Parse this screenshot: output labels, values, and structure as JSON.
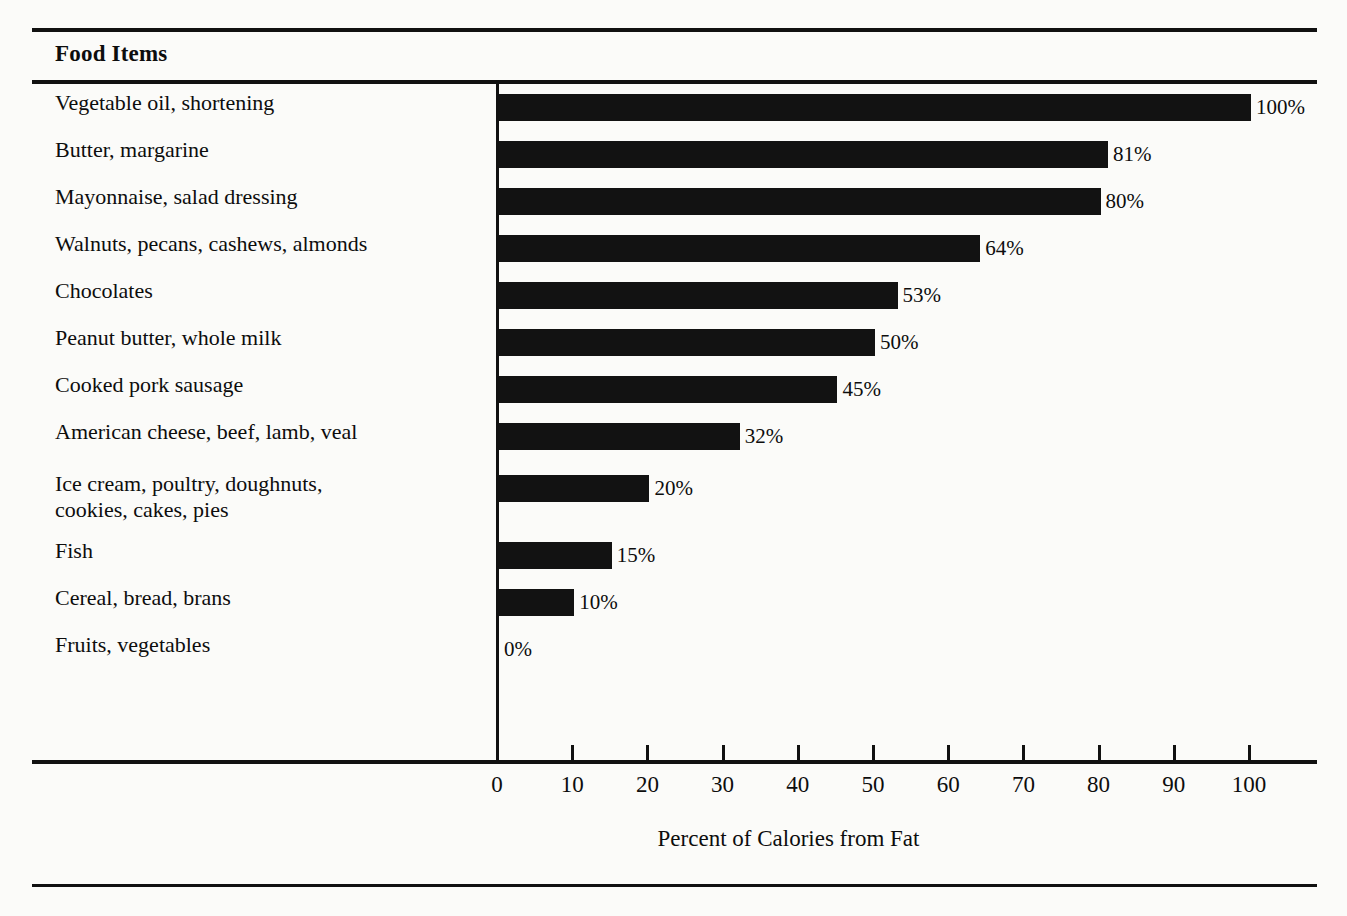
{
  "header": {
    "column_title": "Food Items"
  },
  "chart_data": {
    "type": "bar",
    "orientation": "horizontal",
    "title": "Food Items",
    "xlabel": "Percent of Calories from Fat",
    "ylabel": "",
    "xlim": [
      0,
      100
    ],
    "xticks": [
      0,
      10,
      20,
      30,
      40,
      50,
      60,
      70,
      80,
      90,
      100
    ],
    "xtick_labels": [
      "0",
      "10",
      "20",
      "30",
      "40",
      "50",
      "60",
      "70",
      "80",
      "90",
      "100"
    ],
    "grid": false,
    "legend": null,
    "bar_color": "#121212",
    "background_color": "#fbfbf9",
    "categories": [
      "Vegetable oil, shortening",
      "Butter, margarine",
      "Mayonnaise, salad dressing",
      "Walnuts, pecans, cashews, almonds",
      "Chocolates",
      "Peanut butter, whole milk",
      "Cooked pork sausage",
      "American cheese, beef, lamb, veal",
      "Ice cream, poultry, doughnuts,\ncookies, cakes, pies",
      "Fish",
      "Cereal, bread, brans",
      "Fruits, vegetables"
    ],
    "values": [
      100,
      81,
      80,
      64,
      53,
      50,
      45,
      32,
      20,
      15,
      10,
      0
    ],
    "value_labels": [
      "100%",
      "81%",
      "80%",
      "64%",
      "53%",
      "50%",
      "45%",
      "32%",
      "20%",
      "15%",
      "10%",
      "0%"
    ]
  },
  "rows": [
    {
      "label": "Vegetable oil, shortening",
      "value": 100,
      "value_label": "100%",
      "tall": false
    },
    {
      "label": "Butter, margarine",
      "value": 81,
      "value_label": "81%",
      "tall": false
    },
    {
      "label": "Mayonnaise, salad dressing",
      "value": 80,
      "value_label": "80%",
      "tall": false
    },
    {
      "label": "Walnuts, pecans, cashews, almonds",
      "value": 64,
      "value_label": "64%",
      "tall": false
    },
    {
      "label": "Chocolates",
      "value": 53,
      "value_label": "53%",
      "tall": false
    },
    {
      "label": "Peanut butter, whole milk",
      "value": 50,
      "value_label": "50%",
      "tall": false
    },
    {
      "label": "Cooked pork sausage",
      "value": 45,
      "value_label": "45%",
      "tall": false
    },
    {
      "label": "American cheese, beef, lamb, veal",
      "value": 32,
      "value_label": "32%",
      "tall": false
    },
    {
      "label": "Ice cream, poultry, doughnuts,\ncookies, cakes, pies",
      "value": 20,
      "value_label": "20%",
      "tall": true
    },
    {
      "label": "Fish",
      "value": 15,
      "value_label": "15%",
      "tall": false
    },
    {
      "label": "Cereal, bread, brans",
      "value": 10,
      "value_label": "10%",
      "tall": false
    },
    {
      "label": "Fruits, vegetables",
      "value": 0,
      "value_label": "0%",
      "tall": false
    }
  ],
  "axis": {
    "title": "Percent of Calories from Fat",
    "ticks": [
      "0",
      "10",
      "20",
      "30",
      "40",
      "50",
      "60",
      "70",
      "80",
      "90",
      "100"
    ]
  }
}
